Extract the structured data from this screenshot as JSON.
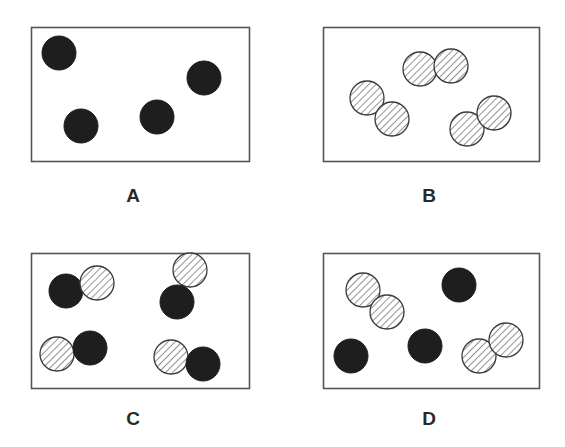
{
  "colors": {
    "filled": "#1e1e1e",
    "hatch": "#3a3a3a",
    "border": "#555555",
    "label": "#2a2a2a"
  },
  "panels": [
    {
      "label": "A",
      "box": {
        "x": 31,
        "y": 27,
        "w": 218,
        "h": 134
      },
      "label_pos": {
        "x": 133,
        "y": 185
      },
      "atoms": [
        {
          "type": "filled",
          "cx": 59,
          "cy": 53
        },
        {
          "type": "filled",
          "cx": 81,
          "cy": 126
        },
        {
          "type": "filled",
          "cx": 157,
          "cy": 117
        },
        {
          "type": "filled",
          "cx": 204,
          "cy": 78
        }
      ]
    },
    {
      "label": "B",
      "box": {
        "x": 323,
        "y": 27,
        "w": 216,
        "h": 134
      },
      "label_pos": {
        "x": 429,
        "y": 185
      },
      "atoms": [
        {
          "type": "hatched",
          "cx": 367,
          "cy": 98
        },
        {
          "type": "hatched",
          "cx": 392,
          "cy": 119
        },
        {
          "type": "hatched",
          "cx": 420,
          "cy": 69
        },
        {
          "type": "hatched",
          "cx": 451,
          "cy": 66
        },
        {
          "type": "hatched",
          "cx": 467,
          "cy": 129
        },
        {
          "type": "hatched",
          "cx": 494,
          "cy": 113
        }
      ]
    },
    {
      "label": "C",
      "box": {
        "x": 31,
        "y": 253,
        "w": 218,
        "h": 135
      },
      "label_pos": {
        "x": 133,
        "y": 408
      },
      "atoms": [
        {
          "type": "filled",
          "cx": 66,
          "cy": 291
        },
        {
          "type": "hatched",
          "cx": 97,
          "cy": 283
        },
        {
          "type": "hatched",
          "cx": 190,
          "cy": 270
        },
        {
          "type": "filled",
          "cx": 177,
          "cy": 302
        },
        {
          "type": "hatched",
          "cx": 57,
          "cy": 354
        },
        {
          "type": "filled",
          "cx": 90,
          "cy": 348
        },
        {
          "type": "hatched",
          "cx": 171,
          "cy": 357
        },
        {
          "type": "filled",
          "cx": 203,
          "cy": 364
        }
      ]
    },
    {
      "label": "D",
      "box": {
        "x": 323,
        "y": 253,
        "w": 216,
        "h": 135
      },
      "label_pos": {
        "x": 429,
        "y": 408
      },
      "atoms": [
        {
          "type": "hatched",
          "cx": 363,
          "cy": 290
        },
        {
          "type": "hatched",
          "cx": 387,
          "cy": 312
        },
        {
          "type": "filled",
          "cx": 459,
          "cy": 285
        },
        {
          "type": "filled",
          "cx": 351,
          "cy": 356
        },
        {
          "type": "filled",
          "cx": 425,
          "cy": 346
        },
        {
          "type": "hatched",
          "cx": 479,
          "cy": 356
        },
        {
          "type": "hatched",
          "cx": 506,
          "cy": 340
        }
      ]
    }
  ],
  "atom_radius": 17
}
